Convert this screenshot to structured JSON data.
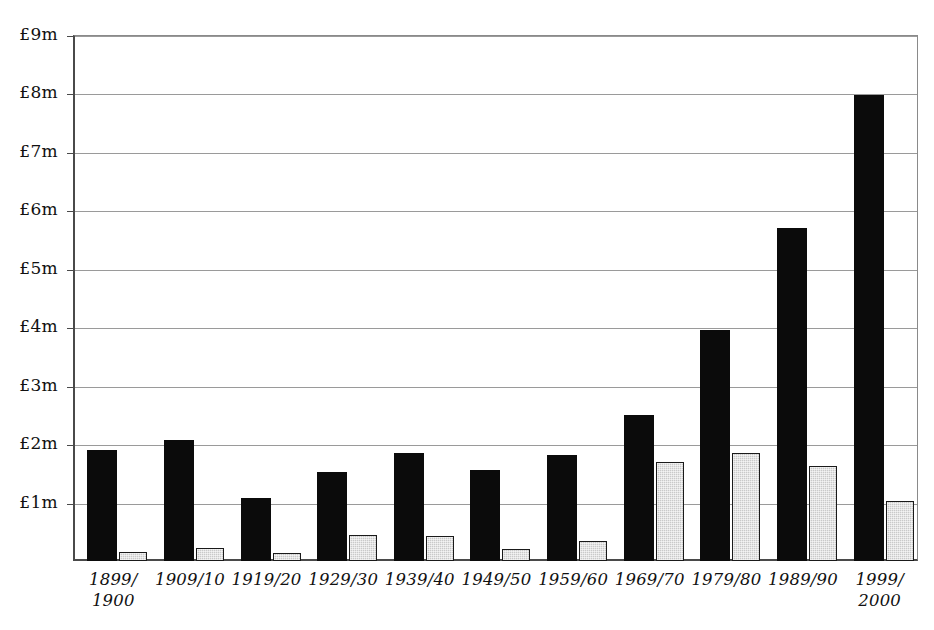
{
  "chart_data": {
    "type": "bar",
    "title": "",
    "xlabel": "",
    "ylabel": "",
    "ylim": [
      0,
      9
    ],
    "grid": true,
    "legend": "none",
    "y_ticks": [
      {
        "value": 1,
        "label": "£1m"
      },
      {
        "value": 2,
        "label": "£2m"
      },
      {
        "value": 3,
        "label": "£3m"
      },
      {
        "value": 4,
        "label": "£4m"
      },
      {
        "value": 5,
        "label": "£5m"
      },
      {
        "value": 6,
        "label": "£6m"
      },
      {
        "value": 7,
        "label": "£7m"
      },
      {
        "value": 8,
        "label": "£8m"
      },
      {
        "value": 9,
        "label": "£9m"
      }
    ],
    "categories": [
      "1899/\n1900",
      "1909/10",
      "1919/20",
      "1929/30",
      "1939/40",
      "1949/50",
      "1959/60",
      "1969/70",
      "1979/80",
      "1989/90",
      "1999/\n2000"
    ],
    "series": [
      {
        "name": "black-series",
        "color": "#0b0b0b",
        "values": [
          1.9,
          2.07,
          1.07,
          1.53,
          1.85,
          1.55,
          1.82,
          2.5,
          3.95,
          5.7,
          7.97
        ]
      },
      {
        "name": "grey-series",
        "color": "#c9c9c9",
        "values": [
          0.15,
          0.22,
          0.13,
          0.45,
          0.43,
          0.2,
          0.35,
          1.7,
          1.85,
          1.62,
          1.02
        ]
      }
    ]
  },
  "axis": {
    "baseline_color": "#4a4a4a",
    "gridline_color": "#9a9a9a"
  }
}
